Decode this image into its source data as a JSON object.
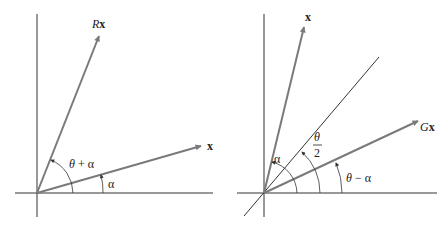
{
  "left_figure": {
    "vector_rx_label_prefix": "R",
    "vector_rx_label_suffix": "x",
    "vector_x_label": "x",
    "angle_theta_plus_alpha": {
      "theta": "θ",
      "op": " + ",
      "alpha": "α"
    },
    "angle_alpha": "α"
  },
  "right_figure": {
    "vector_x_label": "x",
    "vector_gx_label_prefix": "G",
    "vector_gx_label_suffix": "x",
    "angle_alpha": "α",
    "angle_half_theta": {
      "numerator": "θ",
      "denominator": "2"
    },
    "angle_theta_minus_alpha": {
      "theta": "θ",
      "op": " − ",
      "alpha": "α"
    }
  },
  "colors": {
    "axis": "#333333",
    "vector": "#7a7a7a",
    "text": "#222222"
  }
}
